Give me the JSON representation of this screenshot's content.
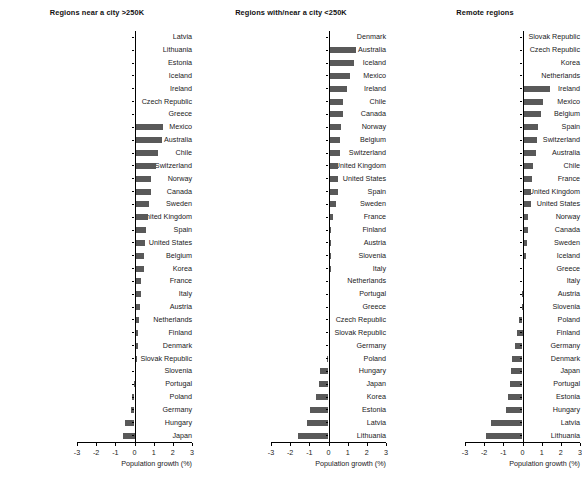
{
  "figure": {
    "width": 582,
    "height": 503,
    "bar_color": "#595959",
    "axis_color": "#000000",
    "background": "#ffffff"
  },
  "chart_data": [
    {
      "type": "bar",
      "orientation": "horizontal",
      "title": "Regions near a city >250K",
      "xlabel": "Population growth (%)",
      "ylabel": "",
      "xlim": [
        -3,
        3
      ],
      "xticks": [
        -3,
        -2,
        -1,
        0,
        1,
        2,
        3
      ],
      "xticklabels": [
        "-3",
        "-2",
        "-1",
        "0",
        "1",
        "2",
        "3"
      ],
      "grid": false,
      "legend": null,
      "categories": [
        "Latvia",
        "Lithuania",
        "Estonia",
        "Iceland",
        "Ireland",
        "Czech Republic",
        "Greece",
        "Mexico",
        "Australia",
        "Chile",
        "Switzerland",
        "Norway",
        "Canada",
        "Sweden",
        "United Kingdom",
        "Spain",
        "United States",
        "Belgium",
        "Korea",
        "France",
        "Italy",
        "Austria",
        "Netherlands",
        "Finland",
        "Denmark",
        "Slovak Republic",
        "Slovenia",
        "Portugal",
        "Poland",
        "Germany",
        "Hungary",
        "Japan"
      ],
      "values": [
        0.0,
        0.0,
        0.0,
        0.0,
        0.0,
        0.0,
        0.0,
        1.5,
        1.42,
        1.25,
        1.12,
        0.88,
        0.85,
        0.78,
        0.68,
        0.62,
        0.55,
        0.5,
        0.48,
        0.35,
        0.32,
        0.28,
        0.26,
        0.2,
        0.16,
        0.12,
        0.05,
        -0.05,
        -0.12,
        -0.2,
        -0.52,
        -0.6
      ]
    },
    {
      "type": "bar",
      "orientation": "horizontal",
      "title": "Regions with/near a city <250K",
      "xlabel": "Population growth (%)",
      "ylabel": "",
      "xlim": [
        -3,
        3
      ],
      "xticks": [
        -3,
        -2,
        -1,
        0,
        1,
        2,
        3
      ],
      "xticklabels": [
        "-3",
        "-2",
        "-1",
        "0",
        "1",
        "2",
        "3"
      ],
      "grid": false,
      "legend": null,
      "categories": [
        "Denmark",
        "Australia",
        "Iceland",
        "Mexico",
        "Ireland",
        "Chile",
        "Canada",
        "Norway",
        "Belgium",
        "Switzerland",
        "United Kingdom",
        "United States",
        "Spain",
        "Sweden",
        "France",
        "Finland",
        "Austria",
        "Slovenia",
        "Italy",
        "Netherlands",
        "Portugal",
        "Greece",
        "Czech Republic",
        "Slovak Republic",
        "Germany",
        "Poland",
        "Hungary",
        "Japan",
        "Korea",
        "Estonia",
        "Latvia",
        "Lithuania"
      ],
      "values": [
        0.0,
        1.42,
        1.32,
        1.1,
        0.98,
        0.78,
        0.75,
        0.65,
        0.62,
        0.6,
        0.52,
        0.5,
        0.5,
        0.38,
        0.25,
        0.14,
        0.13,
        0.12,
        0.11,
        0.1,
        0.03,
        0.02,
        0.0,
        0.0,
        0.0,
        -0.1,
        -0.42,
        -0.52,
        -0.65,
        -0.98,
        -1.12,
        -1.6
      ]
    },
    {
      "type": "bar",
      "orientation": "horizontal",
      "title": "Remote regions",
      "xlabel": "Population growth (%)",
      "ylabel": "",
      "xlim": [
        -3,
        3
      ],
      "xticks": [
        -3,
        -2,
        -1,
        0,
        1,
        2,
        3
      ],
      "xticklabels": [
        "-3",
        "-2",
        "-1",
        "0",
        "1",
        "2",
        "3"
      ],
      "grid": false,
      "legend": null,
      "categories": [
        "Slovak Republic",
        "Czech Republic",
        "Korea",
        "Netherlands",
        "Ireland",
        "Mexico",
        "Belgium",
        "Spain",
        "Switzerland",
        "Australia",
        "Chile",
        "France",
        "United Kingdom",
        "United States",
        "Norway",
        "Canada",
        "Sweden",
        "Iceland",
        "Greece",
        "Italy",
        "Austria",
        "Slovenia",
        "Poland",
        "Finland",
        "Germany",
        "Denmark",
        "Japan",
        "Portugal",
        "Estonia",
        "Hungary",
        "Latvia",
        "Lithuania"
      ],
      "values": [
        0.0,
        0.0,
        0.0,
        0.0,
        1.42,
        1.05,
        0.95,
        0.8,
        0.78,
        0.72,
        0.55,
        0.48,
        0.45,
        0.42,
        0.3,
        0.28,
        0.22,
        0.18,
        0.04,
        0.02,
        -0.02,
        -0.05,
        -0.16,
        -0.3,
        -0.38,
        -0.55,
        -0.62,
        -0.65,
        -0.78,
        -0.85,
        -1.62,
        -1.9
      ]
    }
  ]
}
